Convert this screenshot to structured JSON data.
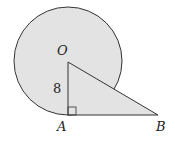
{
  "diagram": {
    "points": {
      "O": "O",
      "A": "A",
      "B": "B"
    },
    "segment_label": "8",
    "fill_color": "#e3e3e3",
    "stroke_color": "#333333"
  }
}
